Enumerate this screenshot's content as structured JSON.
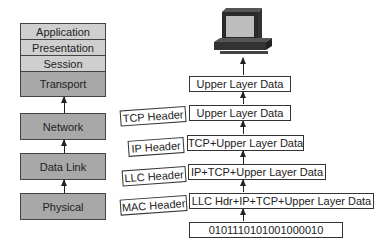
{
  "osi_layers": [
    {
      "name": "Application",
      "shade": "light"
    },
    {
      "name": "Presentation",
      "shade": "light"
    },
    {
      "name": "Session",
      "shade": "light"
    },
    {
      "name": "Transport",
      "shade": "dark"
    },
    {
      "name": "Network",
      "shade": "dark"
    },
    {
      "name": "Data Link",
      "shade": "dark"
    },
    {
      "name": "Physical",
      "shade": "dark"
    }
  ],
  "encapsulation": {
    "top_data": "Upper Layer Data",
    "rows": [
      {
        "header": "TCP Header",
        "data": "Upper Layer Data"
      },
      {
        "header": "IP Header",
        "data": "TCP+Upper Layer Data"
      },
      {
        "header": "LLC Header",
        "data": "IP+TCP+Upper Layer Data"
      },
      {
        "header": "MAC Header",
        "data": "LLC Hdr+IP+TCP+Upper Layer Data"
      }
    ],
    "bits": "0101110101001000010"
  },
  "icons": {
    "computer": "computer-icon"
  },
  "colors": {
    "light_layer": "#cfcfcf",
    "dark_layer": "#a8a8a8",
    "stroke": "#333333"
  }
}
